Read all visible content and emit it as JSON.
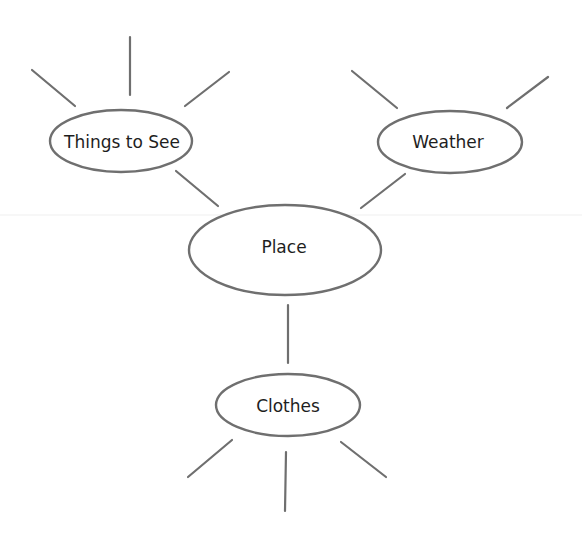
{
  "diagram": {
    "type": "mind-map",
    "colors": {
      "stroke": "#6f6f6f",
      "text": "#1e1e1e",
      "background": "#ffffff"
    },
    "nodes": {
      "center": {
        "label": "Place"
      },
      "top_left": {
        "label": "Things to See"
      },
      "top_right": {
        "label": "Weather"
      },
      "bottom": {
        "label": "Clothes"
      }
    },
    "edges": [
      {
        "from": "Place",
        "to": "Things to See"
      },
      {
        "from": "Place",
        "to": "Weather"
      },
      {
        "from": "Place",
        "to": "Clothes"
      }
    ],
    "empty_spokes": {
      "Things to See": 3,
      "Weather": 2,
      "Clothes": 3
    }
  }
}
